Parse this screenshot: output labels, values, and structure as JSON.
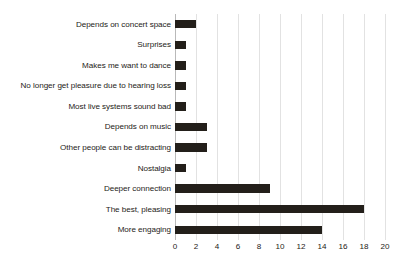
{
  "chart_data": {
    "type": "bar",
    "orientation": "horizontal",
    "title": "",
    "xlabel": "",
    "ylabel": "",
    "xlim": [
      0,
      20
    ],
    "xticks": [
      "0",
      "2",
      "4",
      "6",
      "8",
      "10",
      "12",
      "14",
      "16",
      "18",
      "20"
    ],
    "grid": "vertical",
    "legend": "none",
    "bar_color": "#231f1a",
    "gridline_color": "#e2e2e2",
    "axis_color": "#b9b9b9",
    "text_color": "#1e1b17",
    "categories": [
      "Depends on concert space",
      "Surprises",
      "Makes me want to dance",
      "No longer get pleasure due to hearing loss",
      "Most live systems sound bad",
      "Depends on music",
      "Other people can be distracting",
      "Nostalgia",
      "Deeper connection",
      "The best, pleasing",
      "More engaging"
    ],
    "values": [
      2,
      1,
      1,
      1,
      1,
      3,
      3,
      1,
      9,
      18,
      14
    ]
  }
}
